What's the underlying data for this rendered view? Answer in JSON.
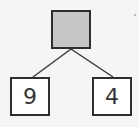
{
  "diagram": {
    "type": "number-bond",
    "whole": {
      "value": "",
      "fill": "#c6c6c6"
    },
    "parts": [
      {
        "value": "9"
      },
      {
        "value": "4"
      }
    ]
  }
}
